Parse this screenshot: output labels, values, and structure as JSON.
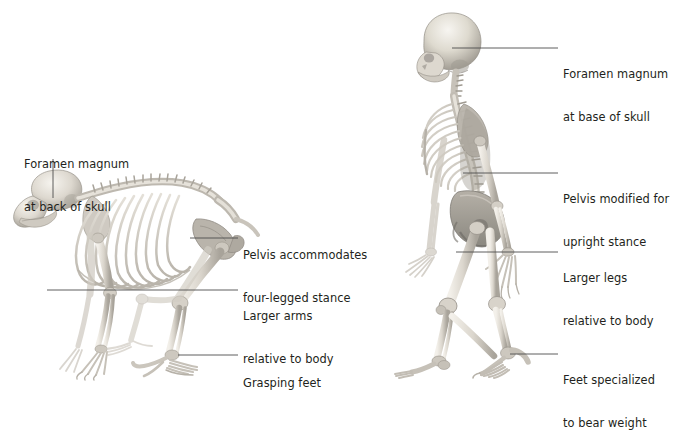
{
  "figure": {
    "background_color": "#ffffff",
    "text_color": "#231f20",
    "leader_line_color": "#4d4d4d",
    "bone_color": "#d8d4cc"
  },
  "left_panel": {
    "name": "ape-skeleton-panel",
    "subject": "quadrupedal-ape-skeleton",
    "labels": [
      {
        "id": "foramen-magnum-ape",
        "line1": "Foramen magnum",
        "line2": "at back of skull",
        "x": 24,
        "y": 129,
        "leader": {
          "type": "vertical",
          "x1": 53,
          "y1": 159,
          "x2": 53,
          "y2": 198
        }
      },
      {
        "id": "pelvis-ape",
        "line1": "Pelvis accommodates",
        "line2": "four-legged stance",
        "x": 243,
        "y": 220,
        "leader": {
          "type": "horizontal",
          "x1": 190,
          "y1": 238,
          "x2": 238,
          "y2": 238
        }
      },
      {
        "id": "larger-arms-ape",
        "line1": "Larger arms",
        "line2": "relative to body",
        "x": 243,
        "y": 281,
        "leader": {
          "type": "horizontal",
          "x1": 47,
          "y1": 290,
          "x2": 238,
          "y2": 290
        }
      },
      {
        "id": "grasping-feet-ape",
        "line1": "Grasping feet",
        "line2": "",
        "x": 243,
        "y": 348,
        "leader": {
          "type": "horizontal",
          "x1": 178,
          "y1": 355,
          "x2": 238,
          "y2": 355
        }
      }
    ]
  },
  "right_panel": {
    "name": "human-skeleton-panel",
    "subject": "bipedal-human-skeleton",
    "labels": [
      {
        "id": "foramen-magnum-human",
        "line1": "Foramen magnum",
        "line2": "at base of skull",
        "x": 563,
        "y": 39,
        "leader": {
          "type": "horizontal",
          "x1": 452,
          "y1": 48,
          "x2": 558,
          "y2": 48
        }
      },
      {
        "id": "pelvis-human",
        "line1": "Pelvis modified for",
        "line2": "upright stance",
        "x": 563,
        "y": 164,
        "leader": {
          "type": "horizontal",
          "x1": 463,
          "y1": 173,
          "x2": 558,
          "y2": 173
        }
      },
      {
        "id": "larger-legs-human",
        "line1": "Larger legs",
        "line2": "relative to body",
        "x": 563,
        "y": 243,
        "leader": {
          "type": "horizontal",
          "x1": 456,
          "y1": 252,
          "x2": 558,
          "y2": 252
        }
      },
      {
        "id": "feet-specialized-human",
        "line1": "Feet specialized",
        "line2": "to bear weight",
        "x": 563,
        "y": 345,
        "leader": {
          "type": "horizontal",
          "x1": 510,
          "y1": 354,
          "x2": 558,
          "y2": 354
        }
      }
    ]
  }
}
